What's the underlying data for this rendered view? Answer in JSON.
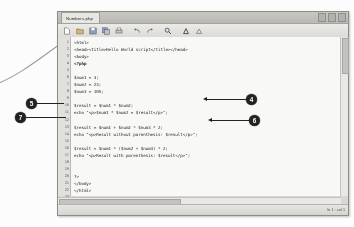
{
  "window": {
    "tab_title": "Numbers.php",
    "controls": [
      "minimize",
      "maximize",
      "close"
    ],
    "toolbar_icons": [
      "new-file-icon",
      "open-folder-icon",
      "save-icon",
      "save-all-icon",
      "print-icon",
      "undo-icon",
      "redo-icon",
      "find-icon",
      "run-icon",
      "stop-icon"
    ],
    "status_text": "ln 1 : col 1"
  },
  "editor": {
    "line_numbers": [
      "1",
      "2",
      "3",
      "4",
      "5",
      "6",
      "7",
      "8",
      "9",
      "10",
      "11",
      "12",
      "13",
      "14",
      "15",
      "16",
      "17",
      "18",
      "19",
      "20",
      "21",
      "22",
      "23"
    ],
    "lines": [
      "<html>",
      "<head><title>Hello World script</title></head>",
      "<body>",
      "<?php",
      "",
      "$num1 = 3;",
      "$num2 = 23;",
      "$num3 = 105;",
      "",
      "$result = $num1 * $num2;",
      "echo \"<p>$num1 * $num2 = $result</p>\";",
      "",
      "$result = $num1 + $num2 * $num3 * 2;",
      "echo \"<p>Result without parenthesis: $result</p>\";",
      "",
      "$result = $num1 * ($num2 + $num3) * 2;",
      "echo \"<p>Result with parenthesis: $result</p>\";",
      "",
      "",
      "?>",
      "</body>",
      "</html>",
      ""
    ],
    "php_line_index": 3
  },
  "callouts": [
    {
      "id": "callout-4",
      "label": "4"
    },
    {
      "id": "callout-5",
      "label": "5"
    },
    {
      "id": "callout-6",
      "label": "6"
    },
    {
      "id": "callout-7",
      "label": "7"
    }
  ]
}
